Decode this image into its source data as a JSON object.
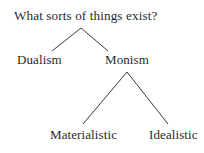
{
  "diagram": {
    "title": "What sorts of things exist?",
    "nodes": [
      {
        "id": "dualism",
        "label": "Dualism",
        "parent": "root"
      },
      {
        "id": "monism",
        "label": "Monism",
        "parent": "root"
      },
      {
        "id": "materialistic",
        "label": "Materialistic",
        "parent": "monism"
      },
      {
        "id": "idealistic",
        "label": "Idealistic",
        "parent": "monism"
      }
    ],
    "edges": [
      {
        "from": "root",
        "to": "dualism"
      },
      {
        "from": "root",
        "to": "monism"
      },
      {
        "from": "monism",
        "to": "materialistic"
      },
      {
        "from": "monism",
        "to": "idealistic"
      }
    ],
    "line_color": "#3a3a3a",
    "text_color": "#2a2a2a"
  }
}
